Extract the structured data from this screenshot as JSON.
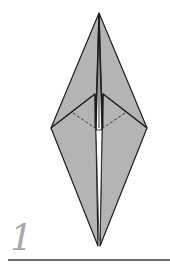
{
  "step": {
    "number": "1"
  },
  "colors": {
    "paper_fill": "#b4b4b4",
    "outline": "#1e1e1e",
    "dashed_fold": "#3a3a3a",
    "step_number": "#a9a9a9",
    "rule": "#6e6e6e"
  }
}
